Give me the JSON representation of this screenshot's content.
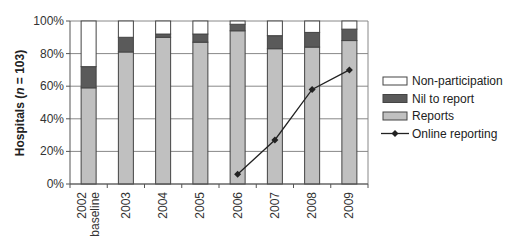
{
  "chart_data": {
    "type": "bar",
    "stacked": true,
    "title": "",
    "xlabel": "",
    "ylabel": "Hospitals (n = 103)",
    "ylabel_parts": [
      "Hospitals (",
      "n",
      " = 103)"
    ],
    "ylim": [
      0,
      100
    ],
    "yticks": [
      "0%",
      "20%",
      "40%",
      "60%",
      "80%",
      "100%"
    ],
    "grid": true,
    "legend_position": "right",
    "categories": [
      "2002 baseline",
      "2003",
      "2004",
      "2005",
      "2006",
      "2007",
      "2008",
      "2009"
    ],
    "category_lines": [
      [
        "2002",
        "baseline"
      ],
      [
        "2003"
      ],
      [
        "2004"
      ],
      [
        "2005"
      ],
      [
        "2006"
      ],
      [
        "2007"
      ],
      [
        "2008"
      ],
      [
        "2009"
      ]
    ],
    "series": [
      {
        "name": "Reports",
        "kind": "bar",
        "color": "#c0c0c0",
        "values": [
          59,
          81,
          90,
          87,
          94,
          83,
          84,
          88
        ]
      },
      {
        "name": "Nil to report",
        "kind": "bar",
        "color": "#5a5a5a",
        "values": [
          13,
          9,
          2,
          5,
          4,
          8,
          9,
          7
        ]
      },
      {
        "name": "Non-participation",
        "kind": "bar",
        "color": "#ffffff",
        "values": [
          28,
          10,
          8,
          8,
          2,
          9,
          7,
          5
        ]
      },
      {
        "name": "Online reporting",
        "kind": "line",
        "color": "#222222",
        "values": [
          null,
          null,
          null,
          null,
          6,
          27,
          58,
          70
        ]
      }
    ],
    "legend": [
      "Non-participation",
      "Nil to report",
      "Reports",
      "Online reporting"
    ]
  }
}
